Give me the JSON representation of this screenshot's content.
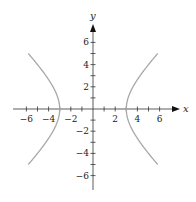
{
  "chart_data": {
    "type": "line",
    "title": "",
    "xlabel": "x",
    "ylabel": "y",
    "xlim": [
      -7,
      7
    ],
    "ylim": [
      -7,
      7
    ],
    "grid": false,
    "legend": null,
    "x_ticks": [
      -6,
      -5,
      -4,
      -3,
      -2,
      -1,
      1,
      2,
      3,
      4,
      5,
      6
    ],
    "x_tick_labels": [
      "−6",
      "−4",
      "−2",
      "2",
      "4",
      "6"
    ],
    "x_tick_label_values": [
      -6,
      -4,
      -2,
      2,
      4,
      6
    ],
    "y_ticks": [
      -6,
      -5,
      -4,
      -3,
      -2,
      -1,
      1,
      2,
      3,
      4,
      5,
      6
    ],
    "y_tick_labels": [
      "6",
      "4",
      "2",
      "−2",
      "−4",
      "−6"
    ],
    "y_tick_label_values": [
      6,
      4,
      2,
      -2,
      -4,
      -6
    ],
    "equation": "x^2/9 - y^2/9 = 1",
    "series": [
      {
        "name": "right branch",
        "points": [
          [
            5.83,
            5
          ],
          [
            5,
            4
          ],
          [
            4.24,
            3
          ],
          [
            3.61,
            2
          ],
          [
            3.16,
            1
          ],
          [
            3,
            0
          ],
          [
            3.16,
            -1
          ],
          [
            3.61,
            -2
          ],
          [
            4.24,
            -3
          ],
          [
            5,
            -4
          ],
          [
            5.83,
            -5
          ]
        ]
      },
      {
        "name": "left branch",
        "points": [
          [
            -5.83,
            5
          ],
          [
            -5,
            4
          ],
          [
            -4.24,
            3
          ],
          [
            -3.61,
            2
          ],
          [
            -3.16,
            1
          ],
          [
            -3,
            0
          ],
          [
            -3.16,
            -1
          ],
          [
            -3.61,
            -2
          ],
          [
            -4.24,
            -3
          ],
          [
            -5,
            -4
          ],
          [
            -5.83,
            -5
          ]
        ]
      }
    ],
    "colors": {
      "curve": "#a8a8a8",
      "axis": "#333333"
    }
  }
}
